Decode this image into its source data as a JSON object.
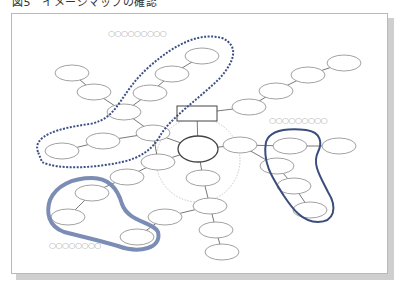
{
  "caption": "図5　イメージマップの確認",
  "labels": [
    {
      "id": "label-top",
      "text": "○○○○○○○○○",
      "x": 108,
      "y": 29
    },
    {
      "id": "label-right",
      "text": "○○○○○○○○○",
      "x": 269,
      "y": 116
    },
    {
      "id": "label-bottom-left",
      "text": "○○○○○○○○",
      "x": 49,
      "y": 241
    }
  ],
  "colors": {
    "node_stroke": "#8a8a8a",
    "hub_stroke": "#444444",
    "edge": "#555555",
    "dotted_circle": "#c8c8c8",
    "dashed_group": "#3c4f86",
    "solid_group_light": "#7b8db5",
    "solid_group_dark": "#3a4d7d"
  },
  "diagram": {
    "hub": {
      "cx": 198,
      "cy": 149,
      "rx": 20,
      "ry": 13
    },
    "title_box": {
      "x": 177,
      "y": 106,
      "w": 40,
      "h": 15
    },
    "dotted_circle": {
      "cx": 198,
      "cy": 160,
      "r": 42
    },
    "nodes": [
      {
        "id": "n1",
        "cx": 72,
        "cy": 73
      },
      {
        "id": "n2",
        "cx": 94,
        "cy": 92
      },
      {
        "id": "n3",
        "cx": 124,
        "cy": 112
      },
      {
        "id": "n4",
        "cx": 150,
        "cy": 93
      },
      {
        "id": "n5",
        "cx": 172,
        "cy": 74
      },
      {
        "id": "n6",
        "cx": 202,
        "cy": 56
      },
      {
        "id": "n7",
        "cx": 153,
        "cy": 133
      },
      {
        "id": "n8",
        "cx": 103,
        "cy": 141
      },
      {
        "id": "n9",
        "cx": 62,
        "cy": 151
      },
      {
        "id": "n10",
        "cx": 158,
        "cy": 162
      },
      {
        "id": "n11",
        "cx": 127,
        "cy": 177
      },
      {
        "id": "n12",
        "cx": 92,
        "cy": 193
      },
      {
        "id": "n13",
        "cx": 68,
        "cy": 217
      },
      {
        "id": "n14",
        "cx": 137,
        "cy": 237
      },
      {
        "id": "n15",
        "cx": 165,
        "cy": 217
      },
      {
        "id": "n16",
        "cx": 203,
        "cy": 178
      },
      {
        "id": "n17",
        "cx": 210,
        "cy": 206
      },
      {
        "id": "n18",
        "cx": 216,
        "cy": 230
      },
      {
        "id": "n19",
        "cx": 222,
        "cy": 252
      },
      {
        "id": "n20",
        "cx": 240,
        "cy": 145
      },
      {
        "id": "n21",
        "cx": 290,
        "cy": 146
      },
      {
        "id": "n22",
        "cx": 339,
        "cy": 146
      },
      {
        "id": "n23",
        "cx": 277,
        "cy": 166
      },
      {
        "id": "n24",
        "cx": 294,
        "cy": 186
      },
      {
        "id": "n25",
        "cx": 310,
        "cy": 210
      },
      {
        "id": "n26",
        "cx": 249,
        "cy": 107
      },
      {
        "id": "n27",
        "cx": 276,
        "cy": 91
      },
      {
        "id": "n28",
        "cx": 308,
        "cy": 75
      },
      {
        "id": "n29",
        "cx": 344,
        "cy": 63
      }
    ],
    "edges": [
      [
        "n1",
        "n2"
      ],
      [
        "n2",
        "n3"
      ],
      [
        "n3",
        "n4"
      ],
      [
        "n4",
        "n5"
      ],
      [
        "n5",
        "n6"
      ],
      [
        "n3",
        "n7"
      ],
      [
        "n7",
        "hub"
      ],
      [
        "n8",
        "n7"
      ],
      [
        "n8",
        "n9"
      ],
      [
        "hub",
        "n10"
      ],
      [
        "n10",
        "n11"
      ],
      [
        "n11",
        "n12"
      ],
      [
        "n12",
        "n13"
      ],
      [
        "n15",
        "n14"
      ],
      [
        "n15",
        "n17"
      ],
      [
        "hub",
        "n16"
      ],
      [
        "n16",
        "n17"
      ],
      [
        "n17",
        "n18"
      ],
      [
        "n18",
        "n19"
      ],
      [
        "hub",
        "n20"
      ],
      [
        "n20",
        "n21"
      ],
      [
        "n21",
        "n22"
      ],
      [
        "n20",
        "n23"
      ],
      [
        "n23",
        "n24"
      ],
      [
        "n24",
        "n25"
      ],
      [
        "title_box",
        "n26"
      ],
      [
        "n26",
        "n27"
      ],
      [
        "n27",
        "n28"
      ],
      [
        "n28",
        "n29"
      ],
      [
        "title_box",
        "hub"
      ],
      [
        "n7",
        "n10"
      ]
    ],
    "groups": [
      {
        "id": "dashed-group",
        "style": "dashed",
        "path": "M 38 152 C 32 136 58 128 90 124 C 120 118 118 94 150 66 C 175 44 200 32 222 38 C 240 46 234 62 220 78 C 200 98 170 118 160 136 C 152 150 140 158 122 162 C 95 168 58 170 42 162 Z"
      },
      {
        "id": "solid-group-left",
        "style": "solid-thick",
        "path": "M 50 200 C 56 186 72 178 92 178 C 110 178 118 190 122 204 C 128 222 154 222 158 232 C 162 248 140 254 118 246 C 98 240 80 236 64 232 C 48 226 46 212 50 200 Z"
      },
      {
        "id": "solid-group-right",
        "style": "solid",
        "path": "M 266 142 C 270 130 286 128 306 130 C 322 132 322 144 318 152 C 312 164 320 176 328 192 C 338 208 334 222 318 222 C 302 222 292 208 284 196 C 274 180 262 164 266 142 Z"
      }
    ]
  }
}
